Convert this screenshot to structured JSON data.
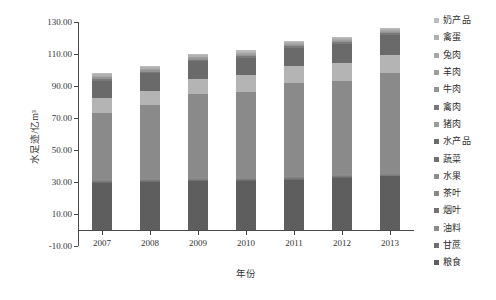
{
  "chart_data": {
    "type": "bar",
    "stacked": true,
    "title": "",
    "xlabel": "年份",
    "ylabel": "水足迹/亿m³",
    "categories": [
      "2007",
      "2008",
      "2009",
      "2010",
      "2011",
      "2012",
      "2013"
    ],
    "ylim": [
      -10.0,
      130.0
    ],
    "ytick_labels": [
      "130.00",
      "110.00",
      "90.00",
      "70.00",
      "50.00",
      "30.00",
      "10.00",
      "-10.00"
    ],
    "ytick_values": [
      130,
      110,
      90,
      70,
      50,
      30,
      10,
      -10
    ],
    "grid": false,
    "legend_position": "right",
    "series": [
      {
        "name": "粮食",
        "color": "#5e5e5e",
        "values": [
          29.5,
          30.0,
          30.5,
          30.8,
          31.5,
          32.5,
          33.5
        ]
      },
      {
        "name": "甘蔗",
        "color": "#6f6f6f",
        "values": [
          0.5,
          0.5,
          0.5,
          0.5,
          0.5,
          0.5,
          0.5
        ]
      },
      {
        "name": "油料",
        "color": "#7b7b7b",
        "values": [
          0.5,
          0.5,
          0.5,
          0.5,
          0.5,
          0.5,
          0.5
        ]
      },
      {
        "name": "烟叶",
        "color": "#828282",
        "values": [
          0.4,
          0.4,
          0.4,
          0.4,
          0.4,
          0.4,
          0.4
        ]
      },
      {
        "name": "茶叶",
        "color": "#888888",
        "values": [
          0.4,
          0.4,
          0.4,
          0.4,
          0.4,
          0.4,
          0.4
        ]
      },
      {
        "name": "水果",
        "color": "#8d8d8d",
        "values": [
          0.6,
          0.6,
          0.6,
          0.6,
          0.6,
          0.6,
          0.6
        ]
      },
      {
        "name": "蔬菜",
        "color": "#8a8a8a",
        "values": [
          41.0,
          45.5,
          52.0,
          53.0,
          58.0,
          58.5,
          62.0
        ]
      },
      {
        "name": "水产品",
        "color": "#b4b4b4",
        "values": [
          9.5,
          9.0,
          9.5,
          10.5,
          10.5,
          11.0,
          11.5
        ]
      },
      {
        "name": "猪肉",
        "color": "#6a6a6a",
        "values": [
          11.0,
          11.0,
          11.0,
          11.0,
          11.5,
          12.0,
          12.5
        ]
      },
      {
        "name": "禽肉",
        "color": "#7a7a7a",
        "values": [
          1.2,
          1.2,
          1.2,
          1.2,
          1.2,
          1.2,
          1.2
        ]
      },
      {
        "name": "牛肉",
        "color": "#949494",
        "values": [
          0.8,
          0.8,
          0.8,
          0.8,
          0.8,
          0.8,
          0.8
        ]
      },
      {
        "name": "羊肉",
        "color": "#9e9e9e",
        "values": [
          0.6,
          0.6,
          0.6,
          0.6,
          0.6,
          0.6,
          0.6
        ]
      },
      {
        "name": "兔肉",
        "color": "#a8a8a8",
        "values": [
          0.3,
          0.3,
          0.3,
          0.3,
          0.3,
          0.3,
          0.3
        ]
      },
      {
        "name": "禽蛋",
        "color": "#b0b0b0",
        "values": [
          1.0,
          1.0,
          1.0,
          1.0,
          1.0,
          1.0,
          1.0
        ]
      },
      {
        "name": "奶产品",
        "color": "#bcbcbc",
        "values": [
          0.7,
          0.7,
          0.7,
          0.7,
          0.7,
          0.7,
          0.7
        ]
      }
    ],
    "totals": [
      97.0,
      100.0,
      107.0,
      110.5,
      113.0,
      116.5,
      122.5
    ]
  },
  "legend": {
    "items": [
      {
        "label": "奶产品",
        "color": "#bcbcbc"
      },
      {
        "label": "禽蛋",
        "color": "#b0b0b0"
      },
      {
        "label": "兔肉",
        "color": "#a8a8a8"
      },
      {
        "label": "羊肉",
        "color": "#9e9e9e"
      },
      {
        "label": "牛肉",
        "color": "#949494"
      },
      {
        "label": "禽肉",
        "color": "#7a7a7a"
      },
      {
        "label": "猪肉",
        "color": "#9a9a9a"
      },
      {
        "label": "水产品",
        "color": "#6a6a6a"
      },
      {
        "label": "蔬菜",
        "color": "#6f6f6f"
      },
      {
        "label": "水果",
        "color": "#8d8d8d"
      },
      {
        "label": "茶叶",
        "color": "#888888"
      },
      {
        "label": "烟叶",
        "color": "#747474"
      },
      {
        "label": "油料",
        "color": "#8a8a8a"
      },
      {
        "label": "甘蔗",
        "color": "#6f6f6f"
      },
      {
        "label": "粮食",
        "color": "#5e5e5e"
      }
    ]
  }
}
